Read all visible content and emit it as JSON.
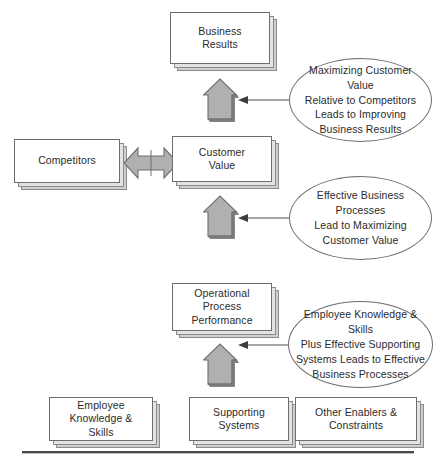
{
  "figure": {
    "type": "flow-diagram",
    "caption_partial": " ",
    "colors": {
      "box_fill": "#ffffff",
      "box_border": "#6e6e6e",
      "shadow_mid": "#e3e3e3",
      "shadow_back": "#cfcfcf",
      "arrow_fill": "#b0b0b0",
      "arrow_border": "#6e6e6e",
      "arrow_shade": "#7d7d7d",
      "rule": "#4a4a4a",
      "text": "#2b2b2b"
    }
  },
  "boxes": {
    "business_results": "Business\nResults",
    "competitors": "Competitors",
    "customer_value": "Customer\nValue",
    "operational_process_performance": "Operational\nProcess\nPerformance",
    "employee_knowledge_skills": "Employee\nKnowledge &\nSkills",
    "supporting_systems": "Supporting\nSystems",
    "other_enablers_constraints": "Other Enablers &\nConstraints"
  },
  "ellipses": {
    "top": "Maximizing Customer Value\nRelative to Competitors\nLeads to Improving\nBusiness Results",
    "middle": "Effective Business Processes\nLead to Maximizing\nCustomer Value",
    "bottom": "Employee Knowledge & Skills\nPlus Effective Supporting\nSystems Leads to Effective\nBusiness Processes"
  },
  "arrows": {
    "up_to_business_results": "up-arrow",
    "up_to_customer_value": "up-arrow",
    "up_to_operational_process": "up-arrow",
    "competitors_customer_value": "double-headed-arrow",
    "connector_top": "arrow-pointing-left",
    "connector_middle": "arrow-pointing-left",
    "connector_bottom": "arrow-pointing-left"
  }
}
